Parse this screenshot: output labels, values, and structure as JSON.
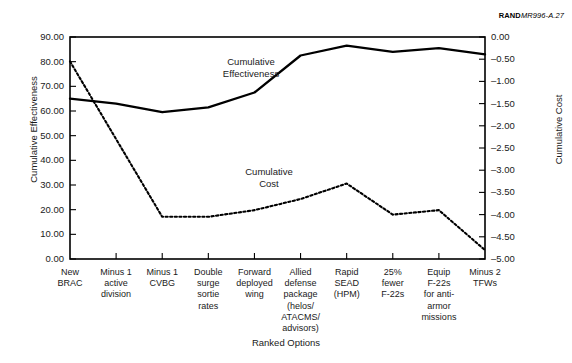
{
  "figure": {
    "source_tag_bold": "RAND",
    "source_tag_italic": "MR996-A.27"
  },
  "chart_data": {
    "type": "line",
    "title": "",
    "xlabel": "Ranked Options",
    "ylabel": "Cumulative Effectiveness",
    "ylabel_right": "Cumulative Cost",
    "grid": false,
    "legend": "inline-annotations",
    "categories": [
      "New BRAC",
      "Minus 1 active division",
      "Minus 1 CVBG",
      "Double surge sortie rates",
      "Forward deployed wing",
      "Allied defense package (helos/ ATACMS/ advisors)",
      "Rapid SEAD (HPM)",
      "25% fewer F-22s",
      "Equip F-22s for anti-armor missions",
      "Minus 2 TFWs"
    ],
    "category_lines": [
      [
        "New",
        "BRAC"
      ],
      [
        "Minus 1",
        "active",
        "division"
      ],
      [
        "Minus 1",
        "CVBG"
      ],
      [
        "Double",
        "surge",
        "sortie",
        "rates"
      ],
      [
        "Forward",
        "deployed",
        "wing"
      ],
      [
        "Allied",
        "defense",
        "package",
        "(helos/",
        "ATACMS/",
        "advisors)"
      ],
      [
        "Rapid",
        "SEAD",
        "(HPM)"
      ],
      [
        "25%",
        "fewer",
        "F-22s"
      ],
      [
        "Equip",
        "F-22s",
        "for anti-",
        "armor",
        "missions"
      ],
      [
        "Minus 2",
        "TFWs"
      ]
    ],
    "ylim": [
      0.0,
      90.0
    ],
    "yticks": [
      0.0,
      10.0,
      20.0,
      30.0,
      40.0,
      50.0,
      60.0,
      70.0,
      80.0,
      90.0
    ],
    "ytick_labels": [
      "0.00",
      "10.00",
      "20.00",
      "30.00",
      "40.00",
      "50.00",
      "60.00",
      "70.00",
      "80.00",
      "90.00"
    ],
    "ylim_right": [
      -5.0,
      0.0
    ],
    "yticks_right": [
      0.0,
      -0.5,
      -1.0,
      -1.5,
      -2.0,
      -2.5,
      -3.0,
      -3.5,
      -4.0,
      -4.5,
      -5.0
    ],
    "ytick_right_labels": [
      "0.00",
      "–0.50",
      "–1.00",
      "–1.50",
      "–2.00",
      "–2.50",
      "–3.00",
      "–3.50",
      "–4.00",
      "–4.50",
      "–5.00"
    ],
    "series": [
      {
        "name": "Cumulative Effectiveness",
        "axis": "left",
        "style": "solid",
        "color": "#000000",
        "values": [
          65.0,
          63.0,
          59.5,
          61.5,
          67.5,
          82.5,
          86.5,
          84.0,
          85.5,
          83.0
        ]
      },
      {
        "name": "Cumulative Cost",
        "axis": "right",
        "style": "dotted",
        "color": "#000000",
        "values": [
          -0.55,
          -2.3,
          -4.05,
          -4.05,
          -3.9,
          -3.65,
          -3.3,
          -4.0,
          -3.9,
          -4.8
        ]
      }
    ],
    "annotations": [
      {
        "text": "Cumulative Effectiveness",
        "series": "Cumulative Effectiveness"
      },
      {
        "text": "Cumulative Cost",
        "series": "Cumulative Cost"
      }
    ]
  }
}
